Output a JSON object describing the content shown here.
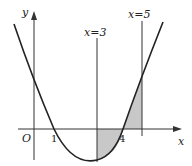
{
  "diagram": {
    "axes": {
      "x_label": "x",
      "y_label": "y",
      "origin_label": "O"
    },
    "tick_labels": [
      "1",
      "4"
    ],
    "vertical_lines": [
      {
        "label": "x=3",
        "x": 3
      },
      {
        "label": "x=5",
        "x": 5
      }
    ],
    "curve": {
      "type": "parabola",
      "roots": [
        1,
        4
      ],
      "description": "upward-opening parabola crossing x-axis at 1 and 4"
    },
    "shaded_regions": [
      {
        "from": 3,
        "to": 4,
        "position": "below x-axis"
      },
      {
        "from": 4,
        "to": 5,
        "position": "above x-axis"
      }
    ],
    "colors": {
      "curve": "#222222",
      "axes": "#333333",
      "shade": "#c8c8c8"
    }
  }
}
